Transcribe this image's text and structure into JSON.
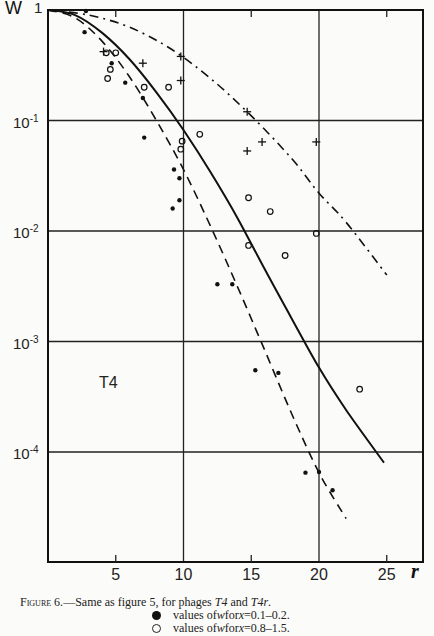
{
  "chart_data": {
    "type": "scatter",
    "title": "",
    "panel_label": "T4",
    "xlabel": "r",
    "ylabel": "W",
    "xscale": "linear",
    "yscale": "log",
    "xlim": [
      0,
      27.7
    ],
    "ylim": [
      1e-05,
      1
    ],
    "x_ticks": [
      5,
      10,
      15,
      20,
      25
    ],
    "x_tick_labels": [
      "5",
      "10",
      "15",
      "20",
      "25"
    ],
    "y_ticks": [
      1,
      0.1,
      0.01,
      0.001,
      0.0001
    ],
    "y_tick_labels": [
      "1",
      "10-1",
      "10-2",
      "10-3",
      "10-4"
    ],
    "grid": {
      "x": [
        10,
        20
      ],
      "y": [
        0.1,
        0.01,
        0.001,
        0.0001
      ]
    },
    "series": [
      {
        "name": "values of w for x=0.1-0.2",
        "marker": "filled-circle",
        "points": [
          [
            2.8,
            0.98
          ],
          [
            2.7,
            0.63
          ],
          [
            4.7,
            0.33
          ],
          [
            5.7,
            0.22
          ],
          [
            7.0,
            0.16
          ],
          [
            7.1,
            0.07
          ],
          [
            9.3,
            0.036
          ],
          [
            9.7,
            0.03
          ],
          [
            9.7,
            0.019
          ],
          [
            9.2,
            0.016
          ],
          [
            12.5,
            0.0033
          ],
          [
            13.6,
            0.0033
          ],
          [
            15.3,
            0.00055
          ],
          [
            17.0,
            0.00052
          ],
          [
            19.0,
            6.5e-05
          ],
          [
            20.0,
            6.6e-05
          ],
          [
            21.0,
            4.5e-05
          ]
        ]
      },
      {
        "name": "values of w for x=0.8-1.5",
        "marker": "open-circle",
        "points": [
          [
            4.3,
            0.41
          ],
          [
            5.0,
            0.41
          ],
          [
            4.6,
            0.29
          ],
          [
            4.4,
            0.24
          ],
          [
            7.1,
            0.2
          ],
          [
            8.9,
            0.2
          ],
          [
            9.8,
            0.055
          ],
          [
            9.9,
            0.065
          ],
          [
            11.2,
            0.075
          ],
          [
            14.8,
            0.02
          ],
          [
            16.4,
            0.015
          ],
          [
            14.8,
            0.0074
          ],
          [
            17.5,
            0.006
          ],
          [
            19.8,
            0.0095
          ],
          [
            23.0,
            0.00037
          ]
        ]
      },
      {
        "name": "T4r",
        "marker": "cross",
        "points": [
          [
            4.1,
            0.42
          ],
          [
            7.0,
            0.33
          ],
          [
            9.8,
            0.38
          ],
          [
            9.8,
            0.23
          ],
          [
            14.7,
            0.12
          ],
          [
            15.8,
            0.064
          ],
          [
            14.7,
            0.053
          ],
          [
            19.8,
            0.064
          ]
        ]
      }
    ],
    "curves": [
      {
        "name": "solid",
        "style": "solid",
        "points": [
          [
            0,
            1
          ],
          [
            2,
            0.9
          ],
          [
            4,
            0.62
          ],
          [
            6,
            0.36
          ],
          [
            8,
            0.18
          ],
          [
            10,
            0.082
          ],
          [
            12,
            0.034
          ],
          [
            14,
            0.013
          ],
          [
            16,
            0.0045
          ],
          [
            18,
            0.0016
          ],
          [
            20,
            0.00058
          ],
          [
            22,
            0.00024
          ],
          [
            24.8,
            8e-05
          ]
        ]
      },
      {
        "name": "dashed",
        "style": "dashed",
        "points": [
          [
            0,
            1
          ],
          [
            2,
            0.85
          ],
          [
            4,
            0.52
          ],
          [
            6,
            0.25
          ],
          [
            8,
            0.1
          ],
          [
            10,
            0.036
          ],
          [
            12,
            0.011
          ],
          [
            14,
            0.0031
          ],
          [
            16,
            0.00083
          ],
          [
            18,
            0.00022
          ],
          [
            20,
            6.5e-05
          ],
          [
            22,
            2.5e-05
          ]
        ]
      },
      {
        "name": "dash-dot",
        "style": "dash-dot",
        "points": [
          [
            0,
            1
          ],
          [
            3,
            0.9
          ],
          [
            6,
            0.7
          ],
          [
            9,
            0.45
          ],
          [
            12,
            0.24
          ],
          [
            15,
            0.11
          ],
          [
            18,
            0.045
          ],
          [
            20,
            0.022
          ],
          [
            22,
            0.012
          ],
          [
            25,
            0.004
          ]
        ]
      }
    ]
  },
  "axes": {
    "y_name": "W",
    "x_name": "r",
    "y_labels": [
      {
        "base": "1",
        "exp": ""
      },
      {
        "base": "10",
        "exp": "-1"
      },
      {
        "base": "10",
        "exp": "-2"
      },
      {
        "base": "10",
        "exp": "-3"
      },
      {
        "base": "10",
        "exp": "-4"
      }
    ],
    "x_labels": [
      "5",
      "10",
      "15",
      "20",
      "25"
    ]
  },
  "panel_label": "T4",
  "caption": {
    "prefix": "Figure 6.",
    "text_1": "—Same as figure 5, for phages ",
    "italic_1": "T4",
    "text_2": " and ",
    "italic_2": "T4r",
    "text_3": "."
  },
  "legend": [
    {
      "marker": "filled",
      "text_1": "values of ",
      "var": "w",
      "text_2": " for ",
      "var2": "x",
      "text_3": "=0.1–0.2."
    },
    {
      "marker": "open",
      "text_1": "values of ",
      "var": "w",
      "text_2": " for ",
      "var2": "x",
      "text_3": "=0.8–1.5."
    }
  ],
  "colors": {
    "ink": "#111111",
    "paper": "#fbfbf9"
  }
}
